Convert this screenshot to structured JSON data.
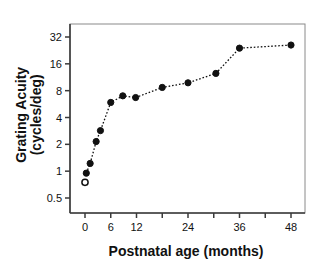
{
  "chart_data": {
    "type": "scatter",
    "title": "",
    "xlabel": "Postnatal age (months)",
    "ylabel_line1": "Grating Acuity",
    "ylabel_line2": "(cycles/deg)",
    "xlim": [
      -2,
      52
    ],
    "ylim": [
      0.5,
      45
    ],
    "yscale": "log2",
    "grid": false,
    "legend": null,
    "xticks": [
      0,
      6,
      12,
      18,
      24,
      30,
      36,
      42,
      48
    ],
    "xticklabels": [
      "0",
      "6",
      "12",
      "",
      "24",
      "",
      "36",
      "",
      "48"
    ],
    "yticks": [
      0.5,
      1,
      2,
      4,
      8,
      16,
      32
    ],
    "yticklabels": [
      "0.5",
      "1",
      "2",
      "4",
      "8",
      "16",
      "32"
    ],
    "series": [
      {
        "name": "open-symbol",
        "marker": "open-circle",
        "connected": false,
        "points": [
          {
            "x": 0,
            "y": 0.75
          }
        ]
      },
      {
        "name": "grating-acuity",
        "marker": "filled-circle",
        "connected": true,
        "linestyle": "dotted",
        "points": [
          {
            "x": 0.3,
            "y": 0.95
          },
          {
            "x": 1.2,
            "y": 1.22
          },
          {
            "x": 2.6,
            "y": 2.15
          },
          {
            "x": 3.6,
            "y": 2.85
          },
          {
            "x": 6.0,
            "y": 5.9
          },
          {
            "x": 8.8,
            "y": 7.0
          },
          {
            "x": 11.8,
            "y": 6.7
          },
          {
            "x": 18.0,
            "y": 8.7
          },
          {
            "x": 24.0,
            "y": 9.8
          },
          {
            "x": 30.5,
            "y": 12.5
          },
          {
            "x": 36.0,
            "y": 24.0
          },
          {
            "x": 48.0,
            "y": 26.0
          }
        ]
      }
    ]
  }
}
